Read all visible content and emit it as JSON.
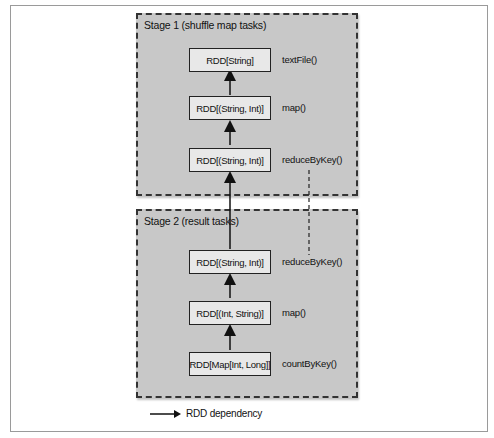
{
  "diagram": {
    "stages": [
      {
        "title": "Stage 1 (shuffle map tasks)",
        "nodes": [
          {
            "label": "RDD[String]",
            "op": "textFile()"
          },
          {
            "label": "RDD[(String, Int)]",
            "op": "map()"
          },
          {
            "label": "RDD[(String, Int)]",
            "op": "reduceByKey()"
          }
        ]
      },
      {
        "title": "Stage 2 (result tasks)",
        "nodes": [
          {
            "label": "RDD[(String, Int)]",
            "op": "reduceByKey()"
          },
          {
            "label": "RDD[(Int, String)]",
            "op": "map()"
          },
          {
            "label": "RDD[Map[Int, Long]]",
            "op": "countByKey()"
          }
        ]
      }
    ],
    "legend": {
      "label": "RDD dependency",
      "icon": "arrow-right-icon"
    },
    "colors": {
      "stage_fill": "#c8c8c8",
      "node_fill": "#e8e8e8",
      "border": "#222222"
    }
  }
}
